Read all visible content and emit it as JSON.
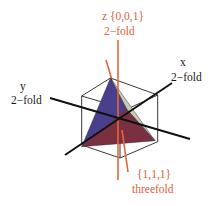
{
  "diagram": {
    "title": "",
    "labels": {
      "z_axis": "z {0,0,1}",
      "z_fold": "2−fold",
      "x_axis": "x",
      "x_fold": "2−fold",
      "y_axis": "y",
      "y_fold": "2−fold",
      "diag_axis": "{1,1,1}",
      "diag_fold": "threefold"
    },
    "colors": {
      "axis_black": "#111111",
      "axis_orange": "#e8643c",
      "face_blue": "#4a3f8c",
      "face_red": "#7a3040",
      "face_light": "#c9cbb2",
      "cube_edge": "#222222"
    }
  }
}
